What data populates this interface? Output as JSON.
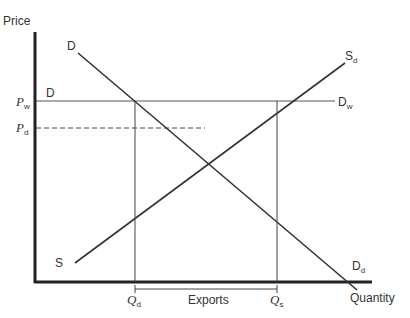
{
  "diagram": {
    "type": "supply-demand-export",
    "axes": {
      "y_label": "Price",
      "x_label": "Quantity"
    },
    "curves": {
      "demand": {
        "label_top": "D",
        "label_end_main": "D",
        "label_end_sub": "d"
      },
      "supply": {
        "label_start": "S",
        "label_end_main": "S",
        "label_end_sub": "d"
      },
      "world_price_line": {
        "label_start": "D",
        "label_end_main": "D",
        "label_end_sub": "w"
      }
    },
    "price_levels": [
      {
        "main": "P",
        "sub": "w",
        "style": "solid"
      },
      {
        "main": "P",
        "sub": "d",
        "style": "dashed"
      }
    ],
    "quantity_marks": [
      {
        "main": "Q",
        "sub": "d"
      },
      {
        "main": "Q",
        "sub": "s"
      }
    ],
    "bracket_label": "Exports",
    "colors": {
      "line": "#333333",
      "axis": "#222222",
      "background": "#ffffff"
    }
  }
}
